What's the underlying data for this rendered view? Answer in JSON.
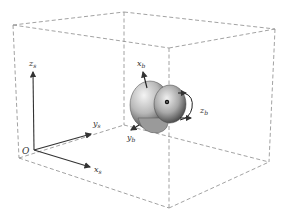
{
  "diagram": {
    "type": "3d-coordinate-frame",
    "inertial_frame": {
      "origin_label": "O",
      "axes": [
        {
          "name": "x",
          "sub": "s",
          "label": "x_s"
        },
        {
          "name": "y",
          "sub": "s",
          "label": "y_s"
        },
        {
          "name": "z",
          "sub": "s",
          "label": "z_s"
        }
      ]
    },
    "body_frame": {
      "axes": [
        {
          "name": "x",
          "sub": "b",
          "label": "x_b"
        },
        {
          "name": "y",
          "sub": "b",
          "label": "y_b"
        },
        {
          "name": "z",
          "sub": "b",
          "label": "z_b"
        }
      ],
      "rotation_indicator": "curved arrow about z_b"
    },
    "colors": {
      "box_line": "#888888",
      "axis": "#333333",
      "body_dark": "#3a3a3a",
      "body_light": "#d8d8d8"
    }
  }
}
